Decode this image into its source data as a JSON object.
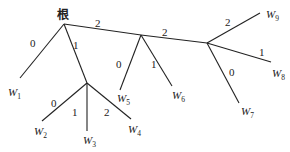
{
  "diagram": {
    "type": "tree",
    "title": "",
    "root": {
      "id": "root",
      "label": "根",
      "x": 64,
      "y": 24,
      "label_x": 57,
      "label_y": 19
    },
    "internal_nodes": [
      {
        "id": "A",
        "x": 87,
        "y": 83
      },
      {
        "id": "B",
        "x": 141,
        "y": 35
      },
      {
        "id": "C",
        "x": 207,
        "y": 43
      }
    ],
    "leaves": [
      {
        "id": "W1",
        "base": "W",
        "sub": "1",
        "x": 20,
        "y": 78,
        "label_x": 8,
        "label_y": 96
      },
      {
        "id": "W2",
        "base": "W",
        "sub": "2",
        "x": 42,
        "y": 121,
        "label_x": 34,
        "label_y": 135
      },
      {
        "id": "W3",
        "base": "W",
        "sub": "3",
        "x": 87,
        "y": 131,
        "label_x": 83,
        "label_y": 144
      },
      {
        "id": "W4",
        "base": "W",
        "sub": "4",
        "x": 131,
        "y": 119,
        "label_x": 128,
        "label_y": 133
      },
      {
        "id": "W5",
        "base": "W",
        "sub": "5",
        "x": 120,
        "y": 90,
        "label_x": 117,
        "label_y": 102
      },
      {
        "id": "W6",
        "base": "W",
        "sub": "6",
        "x": 172,
        "y": 86,
        "label_x": 172,
        "label_y": 99
      },
      {
        "id": "W7",
        "base": "W",
        "sub": "7",
        "x": 239,
        "y": 103,
        "label_x": 241,
        "label_y": 115
      },
      {
        "id": "W8",
        "base": "W",
        "sub": "8",
        "x": 271,
        "y": 62,
        "label_x": 272,
        "label_y": 77
      },
      {
        "id": "W9",
        "base": "W",
        "sub": "9",
        "x": 260,
        "y": 13,
        "label_x": 266,
        "label_y": 18
      }
    ],
    "edges": [
      {
        "from": "root",
        "to": "W1",
        "x1": 64,
        "y1": 24,
        "x2": 20,
        "y2": 78,
        "label": "0",
        "lx": 30,
        "ly": 47
      },
      {
        "from": "root",
        "to": "A",
        "x1": 64,
        "y1": 24,
        "x2": 87,
        "y2": 83,
        "label": "1",
        "lx": 73,
        "ly": 49
      },
      {
        "from": "root",
        "to": "B",
        "x1": 64,
        "y1": 24,
        "x2": 141,
        "y2": 35,
        "label": "2",
        "lx": 95,
        "ly": 27
      },
      {
        "from": "A",
        "to": "W2",
        "x1": 87,
        "y1": 83,
        "x2": 42,
        "y2": 121,
        "label": "0",
        "lx": 51,
        "ly": 107
      },
      {
        "from": "A",
        "to": "W3",
        "x1": 87,
        "y1": 83,
        "x2": 87,
        "y2": 131,
        "label": "1",
        "lx": 72,
        "ly": 116
      },
      {
        "from": "A",
        "to": "W4",
        "x1": 87,
        "y1": 83,
        "x2": 131,
        "y2": 119,
        "label": "2",
        "lx": 104,
        "ly": 116
      },
      {
        "from": "B",
        "to": "W5",
        "x1": 141,
        "y1": 35,
        "x2": 120,
        "y2": 90,
        "label": "0",
        "lx": 116,
        "ly": 68
      },
      {
        "from": "B",
        "to": "W6",
        "x1": 141,
        "y1": 35,
        "x2": 172,
        "y2": 86,
        "label": "1",
        "lx": 151,
        "ly": 68
      },
      {
        "from": "B",
        "to": "C",
        "x1": 141,
        "y1": 35,
        "x2": 207,
        "y2": 43,
        "label": "2",
        "lx": 162,
        "ly": 36
      },
      {
        "from": "C",
        "to": "W9",
        "x1": 207,
        "y1": 43,
        "x2": 260,
        "y2": 13,
        "label": "2",
        "lx": 225,
        "ly": 26
      },
      {
        "from": "C",
        "to": "W8",
        "x1": 207,
        "y1": 43,
        "x2": 271,
        "y2": 62,
        "label": "1",
        "lx": 259,
        "ly": 56
      },
      {
        "from": "C",
        "to": "W7",
        "x1": 207,
        "y1": 43,
        "x2": 239,
        "y2": 103,
        "label": "0",
        "lx": 229,
        "ly": 76
      }
    ]
  }
}
